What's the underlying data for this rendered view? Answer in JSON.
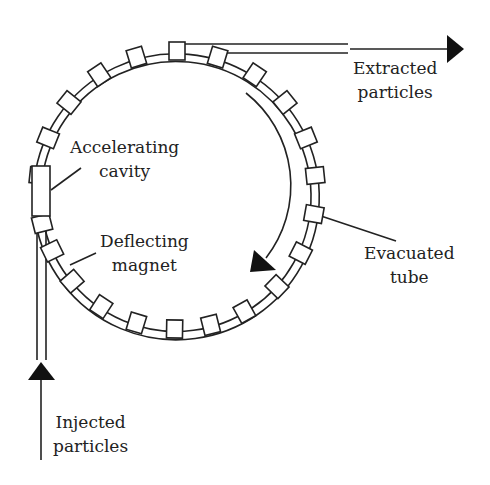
{
  "diagram": {
    "colors": {
      "stroke": "#222222",
      "background": "#ffffff"
    },
    "labels": {
      "accelerating_cavity": [
        "Accelerating",
        "cavity"
      ],
      "deflecting_magnet": [
        "Deflecting",
        "magnet"
      ],
      "extracted_particles": [
        "Extracted",
        "particles"
      ],
      "evacuated_tube": [
        "Evacuated",
        "tube"
      ],
      "injected_particles": [
        "Injected",
        "particles"
      ]
    },
    "ring": {
      "center": [
        177,
        190
      ],
      "outer_radius": 143,
      "inner_radius": 135,
      "magnet_count_visible": 22,
      "circulation_direction": "clockwise"
    }
  }
}
